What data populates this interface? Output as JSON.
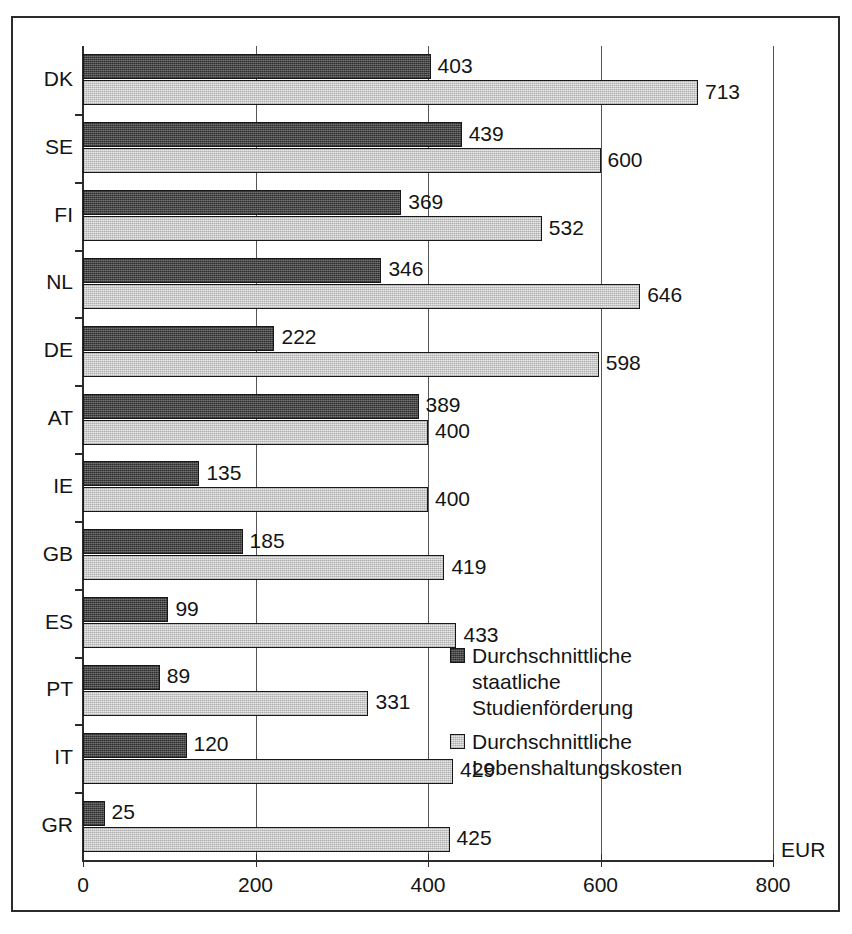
{
  "chart_data": {
    "type": "bar",
    "orientation": "horizontal",
    "title": "",
    "xlabel": "EUR",
    "ylabel": "",
    "xlim": [
      0,
      800
    ],
    "xticks": [
      0,
      200,
      400,
      600,
      800
    ],
    "xtick_labels": [
      "0",
      "200",
      "400",
      "600",
      "800"
    ],
    "grid": true,
    "grid_axis": "x",
    "legend_position": "inside-right-lower",
    "categories": [
      "DK",
      "SE",
      "FI",
      "NL",
      "DE",
      "AT",
      "IE",
      "GB",
      "ES",
      "PT",
      "IT",
      "GR"
    ],
    "series": [
      {
        "name": "Durchschnittliche staatliche Studienförderung",
        "name_lines": [
          "Durchschnittliche",
          "staatliche",
          "Studienförderung"
        ],
        "color": "#58585a",
        "values": [
          403,
          439,
          369,
          346,
          222,
          389,
          135,
          185,
          99,
          89,
          120,
          25
        ]
      },
      {
        "name": "Durchschnittliche Lebenshaltungskosten",
        "name_lines": [
          "Durchschnittliche",
          "Lebenshaltungskosten"
        ],
        "color": "#d2d2d2",
        "values": [
          713,
          600,
          532,
          646,
          598,
          400,
          400,
          419,
          433,
          331,
          429,
          425
        ]
      }
    ]
  },
  "legend": {
    "entries": [
      {
        "swatch": "dark",
        "line1": "Durchschnittliche",
        "line2": "staatliche",
        "line3": "Studienförderung"
      },
      {
        "swatch": "light",
        "line1": "Durchschnittliche",
        "line2": "Lebenshaltungskosten",
        "line3": ""
      }
    ]
  },
  "axis": {
    "unit_label": "EUR"
  }
}
